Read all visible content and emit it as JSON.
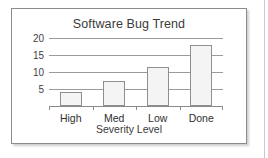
{
  "chart_data": {
    "type": "bar",
    "title": "Software Bug Trend",
    "xlabel": "Severity Level",
    "ylabel": "",
    "categories": [
      "High",
      "Med",
      "Low",
      "Done"
    ],
    "values": [
      4,
      7.5,
      11.5,
      18
    ],
    "yticks": [
      5,
      10,
      15,
      20
    ],
    "ytick_labels": [
      "5",
      "10",
      "15",
      "20"
    ],
    "ylim": [
      0,
      20
    ],
    "grid": true,
    "legend": false,
    "colors": {
      "bar_fill": "#f4f4f4",
      "bar_stroke": "#8f8f8f",
      "gridline": "#9a9a9a",
      "axis": "#8a8a8a",
      "text": "#3a3a3a",
      "frame": "#8c8c8c",
      "background": "#ffffff"
    }
  }
}
